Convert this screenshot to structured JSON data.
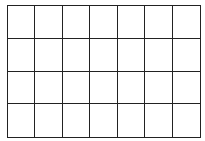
{
  "grid": {
    "rows": 4,
    "columns": 7,
    "line_color": "#222222",
    "background": "#ffffff",
    "cells": [
      [
        "",
        "",
        "",
        "",
        "",
        "",
        ""
      ],
      [
        "",
        "",
        "",
        "",
        "",
        "",
        ""
      ],
      [
        "",
        "",
        "",
        "",
        "",
        "",
        ""
      ],
      [
        "",
        "",
        "",
        "",
        "",
        "",
        ""
      ]
    ]
  }
}
